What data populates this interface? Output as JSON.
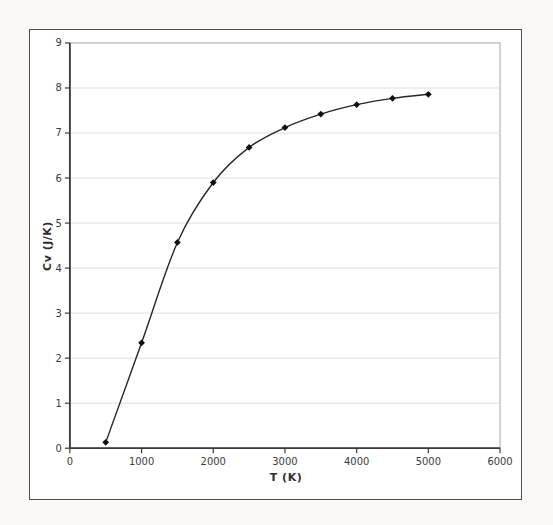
{
  "page": {
    "background_color": "#faf9f7"
  },
  "chart_frame": {
    "border_color": "#4d4d4d",
    "background_color": "#ffffff"
  },
  "chart_data": {
    "type": "line",
    "title": "",
    "xlabel": "T (K)",
    "ylabel": "Cv (J/K)",
    "x": [
      500,
      1000,
      1500,
      2000,
      2500,
      3000,
      3500,
      4000,
      4500,
      5000
    ],
    "y": [
      0.13,
      2.34,
      4.57,
      5.9,
      6.68,
      7.12,
      7.42,
      7.63,
      7.77,
      7.86
    ],
    "xlim": [
      0,
      6000
    ],
    "ylim": [
      0,
      9
    ],
    "xticks": [
      0,
      1000,
      2000,
      3000,
      4000,
      5000,
      6000
    ],
    "yticks": [
      0,
      1,
      2,
      3,
      4,
      5,
      6,
      7,
      8,
      9
    ],
    "grid": "horizontal-major-only",
    "legend": "none",
    "line_smooth": true,
    "marker": "diamond",
    "colors": {
      "line": "#262626",
      "marker": "#111111",
      "gridline": "#dedede",
      "plot_border": "#a3a3a3",
      "axis": "#3a3a3a",
      "tick_text": "#3a3a3a"
    }
  }
}
